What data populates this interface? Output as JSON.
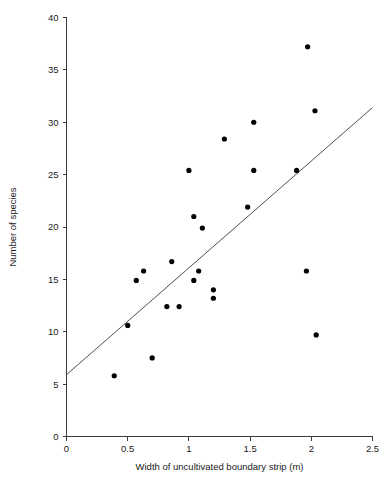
{
  "chart_data": {
    "type": "scatter",
    "title": "",
    "xlabel": "Width of uncultivated boundary strip (m)",
    "ylabel": "Number of species",
    "xlim": [
      0,
      2.5
    ],
    "ylim": [
      0,
      40
    ],
    "grid": false,
    "legend": null,
    "xticks": [
      "0",
      "0.5",
      "1",
      "1.5",
      "2",
      "2.5"
    ],
    "xtick_values": [
      0,
      0.5,
      1,
      1.5,
      2,
      2.5
    ],
    "yticks": [
      "0",
      "5",
      "10",
      "15",
      "20",
      "25",
      "30",
      "35",
      "40"
    ],
    "ytick_values": [
      0,
      5,
      10,
      15,
      20,
      25,
      30,
      35,
      40
    ],
    "points": [
      {
        "x": 0.39,
        "y": 5.8
      },
      {
        "x": 0.5,
        "y": 10.6
      },
      {
        "x": 0.57,
        "y": 14.9
      },
      {
        "x": 0.63,
        "y": 15.8
      },
      {
        "x": 0.7,
        "y": 7.5
      },
      {
        "x": 0.82,
        "y": 12.4
      },
      {
        "x": 0.86,
        "y": 16.7
      },
      {
        "x": 0.92,
        "y": 12.4
      },
      {
        "x": 1.0,
        "y": 25.4
      },
      {
        "x": 1.04,
        "y": 21.0
      },
      {
        "x": 1.04,
        "y": 14.9
      },
      {
        "x": 1.08,
        "y": 15.8
      },
      {
        "x": 1.11,
        "y": 19.9
      },
      {
        "x": 1.2,
        "y": 14.0
      },
      {
        "x": 1.2,
        "y": 13.2
      },
      {
        "x": 1.29,
        "y": 28.4
      },
      {
        "x": 1.53,
        "y": 30.0
      },
      {
        "x": 1.53,
        "y": 25.4
      },
      {
        "x": 1.48,
        "y": 21.9
      },
      {
        "x": 1.88,
        "y": 25.4
      },
      {
        "x": 1.96,
        "y": 15.8
      },
      {
        "x": 1.97,
        "y": 37.2
      },
      {
        "x": 2.03,
        "y": 31.1
      },
      {
        "x": 2.04,
        "y": 9.7
      }
    ],
    "fit_line": {
      "x1": 0,
      "y1": 5.9,
      "x2": 2.5,
      "y2": 31.4
    }
  }
}
